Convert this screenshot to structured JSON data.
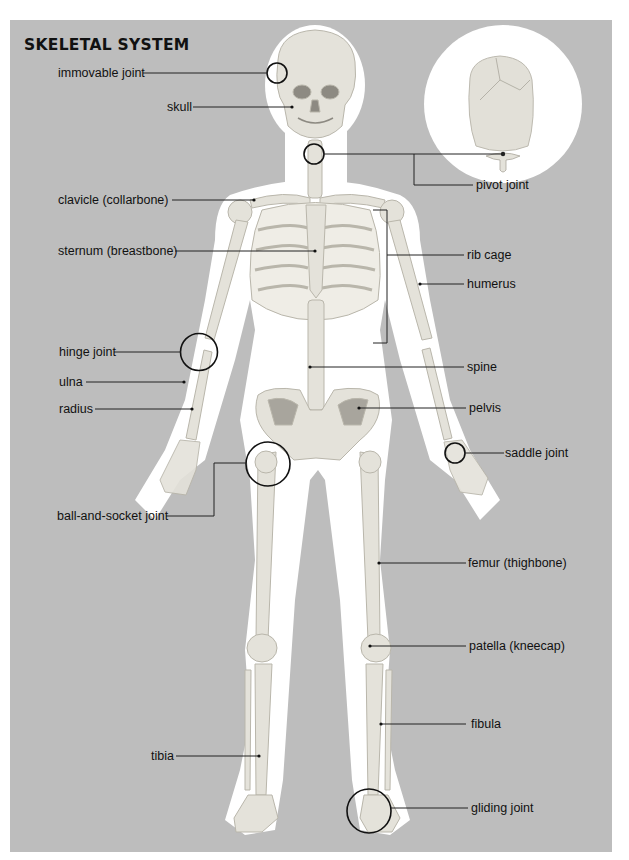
{
  "title": "SKELETAL SYSTEM",
  "colors": {
    "background": "#bdbdbd",
    "silhouette": "#ffffff",
    "bone": "#e4e2da",
    "bone_shade": "#c9c6bc",
    "leader": "#222222"
  },
  "labels": {
    "immovable_joint": "immovable joint",
    "skull": "skull",
    "pivot_joint": "pivot joint",
    "clavicle": "clavicle (collarbone)",
    "sternum": "sternum (breastbone)",
    "rib_cage": "rib cage",
    "humerus": "humerus",
    "hinge_joint": "hinge joint",
    "ulna": "ulna",
    "radius": "radius",
    "spine": "spine",
    "pelvis": "pelvis",
    "saddle_joint": "saddle joint",
    "ball_and_socket_joint": "ball-and-socket joint",
    "femur": "femur (thighbone)",
    "patella": "patella (kneecap)",
    "fibula": "fibula",
    "tibia": "tibia",
    "gliding_joint": "gliding joint"
  }
}
